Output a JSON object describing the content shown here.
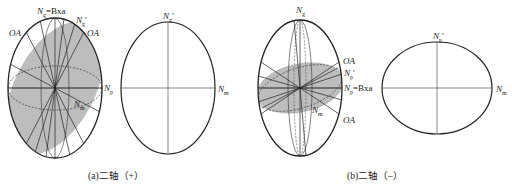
{
  "figure_a": {
    "caption": "(a)二轴（+）",
    "left": {
      "top_label": "Ng=Bxa",
      "top_label_main": "N",
      "top_label_sub": "g",
      "top_label_rest": "=Bxa",
      "ng_prime": "N",
      "ng_prime_sub": "g",
      "ng_prime_mark": "′",
      "oa_left": "OA",
      "oa_right": "OA",
      "np": "N",
      "np_sub": "p",
      "nm": "N",
      "nm_sub": "m"
    },
    "right": {
      "top_label": "N",
      "top_sub": "g",
      "top_mark": "′",
      "right_label": "N",
      "right_sub": "m"
    }
  },
  "figure_b": {
    "caption": "(b)二轴（–）",
    "left": {
      "top_label": "N",
      "top_sub": "g",
      "oa_top": "OA",
      "oa_bottom": "OA",
      "np_prime": "N",
      "np_prime_sub": "p",
      "np_prime_mark": "′",
      "np_bxa": "N",
      "np_bxa_sub": "p",
      "np_bxa_rest": "=Bxa",
      "nm": "N",
      "nm_sub": "m"
    },
    "right": {
      "top_label": "N",
      "top_sub": "p",
      "top_mark": "′",
      "right_label": "N",
      "right_sub": "m"
    }
  },
  "colors": {
    "line": "#222222",
    "shade": "#bdbdbd"
  }
}
